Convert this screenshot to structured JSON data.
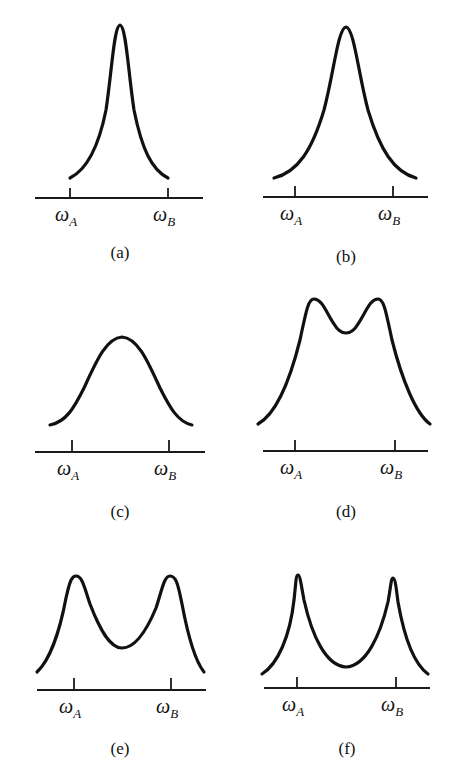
{
  "figure": {
    "panel_count": 6,
    "line_color": "#111111",
    "background": "#ffffff"
  },
  "panels": [
    {
      "id": "a",
      "label": "(a)",
      "shape": "single narrow peak centered between ωA and ωB",
      "tick_a": {
        "symbol": "ω",
        "sub": "A"
      },
      "tick_b": {
        "symbol": "ω",
        "sub": "B"
      }
    },
    {
      "id": "b",
      "label": "(b)",
      "shape": "single broader peak centered between ωA and ωB",
      "tick_a": {
        "symbol": "ω",
        "sub": "A"
      },
      "tick_b": {
        "symbol": "ω",
        "sub": "B"
      }
    },
    {
      "id": "c",
      "label": "(c)",
      "shape": "single broad flat-topped peak",
      "tick_a": {
        "symbol": "ω",
        "sub": "A"
      },
      "tick_b": {
        "symbol": "ω",
        "sub": "B"
      }
    },
    {
      "id": "d",
      "label": "(d)",
      "shape": "two partially merged peaks with shallow central dip",
      "tick_a": {
        "symbol": "ω",
        "sub": "A"
      },
      "tick_b": {
        "symbol": "ω",
        "sub": "B"
      }
    },
    {
      "id": "e",
      "label": "(e)",
      "shape": "two resolved peaks near ωA and ωB with deeper central dip",
      "tick_a": {
        "symbol": "ω",
        "sub": "A"
      },
      "tick_b": {
        "symbol": "ω",
        "sub": "B"
      }
    },
    {
      "id": "f",
      "label": "(f)",
      "shape": "two sharp peaks at ωA and ωB with deep central minimum",
      "tick_a": {
        "symbol": "ω",
        "sub": "A"
      },
      "tick_b": {
        "symbol": "ω",
        "sub": "B"
      }
    }
  ]
}
